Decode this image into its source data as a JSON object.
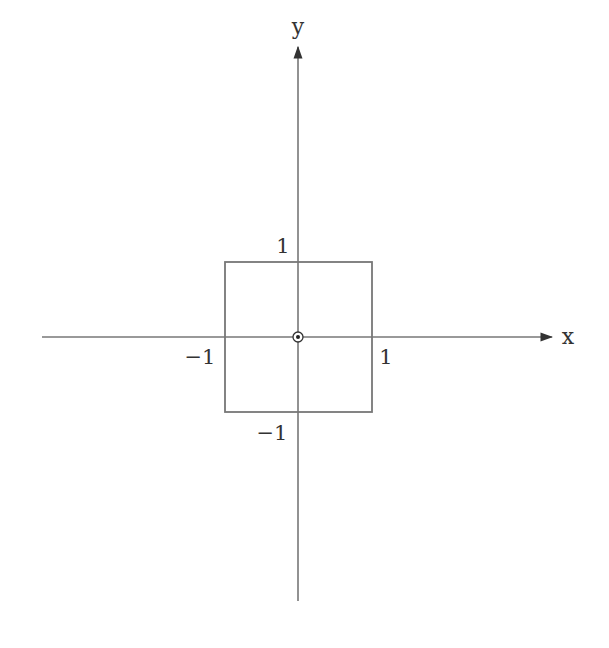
{
  "diagram": {
    "type": "coordinate-plane",
    "axes": {
      "x_label": "x",
      "y_label": "y",
      "color": "#777777"
    },
    "square": {
      "vertices": [
        [
          -1,
          -1
        ],
        [
          1,
          -1
        ],
        [
          1,
          1
        ],
        [
          -1,
          1
        ]
      ],
      "color": "#777777"
    },
    "tick_labels": {
      "x_pos": "1",
      "x_neg": "−1",
      "y_pos": "1",
      "y_neg": "−1"
    },
    "origin_marker": "circled-dot"
  }
}
